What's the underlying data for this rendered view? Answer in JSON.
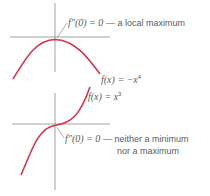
{
  "diagram": {
    "top_graph": {
      "function_label": "f(x) = −x⁴",
      "function_base": "−x",
      "function_exp": "4",
      "annotation_prefix": "f″(0) = 0",
      "annotation_text": "— a local maximum",
      "curve_color": "#d0354a",
      "axis_color": "#8a8a8a"
    },
    "bottom_graph": {
      "function_label": "f(x) = x³",
      "function_base": "x",
      "function_exp": "3",
      "annotation_prefix": "f″(0) = 0",
      "annotation_text_line1": "— neither a minimum",
      "annotation_text_line2": "nor a maximum",
      "curve_color": "#d0354a",
      "axis_color": "#8a8a8a"
    }
  }
}
